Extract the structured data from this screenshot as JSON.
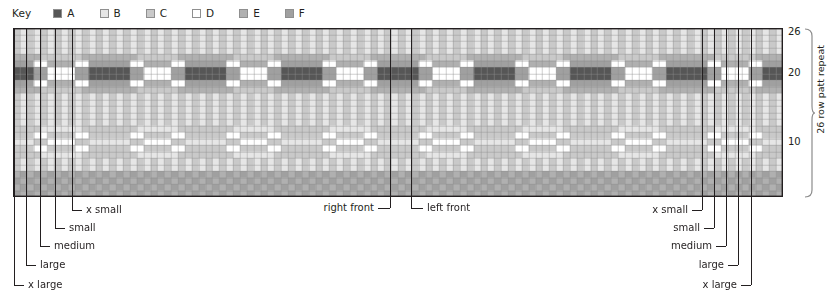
{
  "key": {
    "title": "Key",
    "entries": [
      {
        "label": "A",
        "color": "#565656"
      },
      {
        "label": "B",
        "color": "#e6e6e6"
      },
      {
        "label": "C",
        "color": "#c9c9c9"
      },
      {
        "label": "D",
        "color": "#ffffff"
      },
      {
        "label": "E",
        "color": "#b0b0b0"
      },
      {
        "label": "F",
        "color": "#a0a0a0"
      }
    ]
  },
  "chart": {
    "type": "colorwork-grid",
    "columns": 112,
    "rows": 26,
    "cell_w": 6.87,
    "cell_h": 6.46,
    "grid_line_color": "#8f8f8f",
    "border_color": "#231f20",
    "row_numbers": [
      {
        "value": "26",
        "row": 26
      },
      {
        "value": "20",
        "row": 20
      },
      {
        "value": "10",
        "row": 10
      }
    ],
    "repeat_label": "26 row patt repeat",
    "palette": {
      "A": "#565656",
      "B": "#e6e6e6",
      "C": "#c9c9c9",
      "D": "#ffffff",
      "E": "#b0b0b0",
      "F": "#a0a0a0"
    },
    "row_patterns": [
      {
        "row": 26,
        "seq": "CBCB"
      },
      {
        "row": 25,
        "seq": "BCBC"
      },
      {
        "row": 24,
        "seq": "CBCB"
      },
      {
        "row": 23,
        "seq": "BCBC"
      },
      {
        "row": 22,
        "seq": "EF"
      },
      {
        "row": 21,
        "seq": "FEDE"
      },
      {
        "row": 20,
        "seq": "AFAD"
      },
      {
        "row": 19,
        "seq": "ADAF"
      },
      {
        "row": 18,
        "seq": "FEDE"
      },
      {
        "row": 17,
        "seq": "EFEC"
      },
      {
        "row": 16,
        "seq": "CBCB"
      },
      {
        "row": 15,
        "seq": "BCBC"
      },
      {
        "row": 14,
        "seq": "CBCB"
      },
      {
        "row": 13,
        "seq": "BCBC"
      },
      {
        "row": 12,
        "seq": "CBCB"
      },
      {
        "row": 11,
        "seq": "BCDC"
      },
      {
        "row": 10,
        "seq": "CDCB"
      },
      {
        "row": 9,
        "seq": "DCDB"
      },
      {
        "row": 8,
        "seq": "CDCB"
      },
      {
        "row": 7,
        "seq": "BCDC"
      },
      {
        "row": 6,
        "seq": "CBCB"
      },
      {
        "row": 5,
        "seq": "BCBC"
      },
      {
        "row": 4,
        "seq": "EFEF"
      },
      {
        "row": 3,
        "seq": "FEFE"
      },
      {
        "row": 2,
        "seq": "EFEF"
      },
      {
        "row": 1,
        "seq": "FEFE"
      }
    ]
  },
  "markers": {
    "left": [
      {
        "label": "x small",
        "x": 72
      },
      {
        "label": "small",
        "x": 55
      },
      {
        "label": "medium",
        "x": 40
      },
      {
        "label": "large",
        "x": 26
      },
      {
        "label": "x large",
        "x": 14
      }
    ],
    "center": [
      {
        "label": "right front",
        "x": 390
      },
      {
        "label": "left front",
        "x": 411
      }
    ],
    "right": [
      {
        "label": "x small",
        "x": 702
      },
      {
        "label": "small",
        "x": 714
      },
      {
        "label": "medium",
        "x": 726
      },
      {
        "label": "large",
        "x": 738
      },
      {
        "label": "x large",
        "x": 751
      }
    ]
  }
}
